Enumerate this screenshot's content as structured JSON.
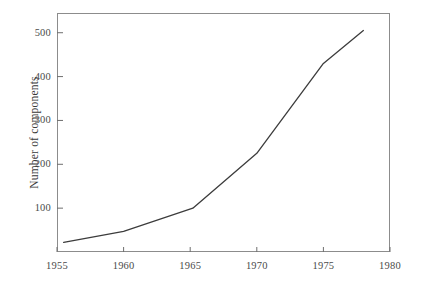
{
  "chart_data": {
    "type": "line",
    "title": "",
    "subtitle": "",
    "xlabel": "",
    "ylabel": "Number of components",
    "xlim": [
      1955,
      1980
    ],
    "ylim": [
      0,
      545
    ],
    "grid": false,
    "legend": null,
    "xticks": [
      1955,
      1960,
      1965,
      1970,
      1975,
      1980
    ],
    "xtick_labels": [
      "1955",
      "1960",
      "1965",
      "1970",
      "1975",
      "1980"
    ],
    "yticks": [
      100,
      200,
      300,
      400,
      500
    ],
    "ytick_labels": [
      "100",
      "200",
      "300",
      "400",
      "500"
    ],
    "series": [
      {
        "name": "Number of components",
        "color": "#3c3c3c",
        "x": [
          1955.5,
          1960.0,
          1965.2,
          1970.0,
          1975.0,
          1978.0
        ],
        "values": [
          22,
          47,
          100,
          225,
          430,
          505
        ]
      }
    ]
  },
  "axes": {
    "frame_color": "#8c8c8c",
    "tick_color": "#6e6e6e",
    "label_color": "#4a4a4a"
  }
}
